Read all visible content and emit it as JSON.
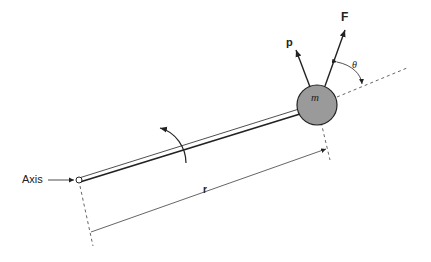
{
  "diagram": {
    "labels": {
      "axis": "Axis",
      "radius": "r",
      "mass": "m",
      "force": "F",
      "momentum": "p",
      "angle": "θ"
    },
    "colors": {
      "mass_fill": "#9a9a9a",
      "line": "#222222"
    }
  }
}
